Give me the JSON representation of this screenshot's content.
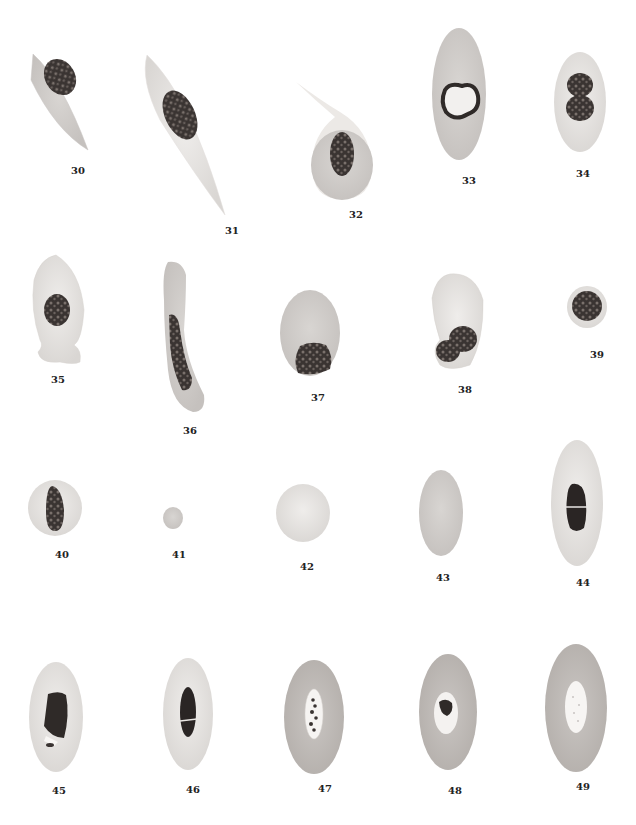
{
  "plate": {
    "figures": [
      {
        "id": "30",
        "label": "30",
        "shape": "spindle",
        "nucleus": "oval-granular"
      },
      {
        "id": "31",
        "label": "31",
        "shape": "elongated-spindle",
        "nucleus": "oval-granular"
      },
      {
        "id": "32",
        "label": "32",
        "shape": "teardrop-with-tail",
        "nucleus": "oval-granular"
      },
      {
        "id": "33",
        "label": "33",
        "shape": "oval",
        "nucleus": "lobed-ring"
      },
      {
        "id": "34",
        "label": "34",
        "shape": "oval",
        "nucleus": "constricted-double"
      },
      {
        "id": "35",
        "label": "35",
        "shape": "pear-with-bulb",
        "nucleus": "oval-granular"
      },
      {
        "id": "36",
        "label": "36",
        "shape": "curved-rod",
        "nucleus": "elongated"
      },
      {
        "id": "37",
        "label": "37",
        "shape": "oval",
        "nucleus": "basal-granular"
      },
      {
        "id": "38",
        "label": "38",
        "shape": "kidney",
        "nucleus": "dividing-double"
      },
      {
        "id": "39",
        "label": "39",
        "shape": "small-round",
        "nucleus": "round-granular"
      },
      {
        "id": "40",
        "label": "40",
        "shape": "round",
        "nucleus": "eccentric-oval"
      },
      {
        "id": "41",
        "label": "41",
        "shape": "tiny-round",
        "nucleus": "none"
      },
      {
        "id": "42",
        "label": "42",
        "shape": "round",
        "nucleus": "none"
      },
      {
        "id": "43",
        "label": "43",
        "shape": "oval",
        "nucleus": "none"
      },
      {
        "id": "44",
        "label": "44",
        "shape": "large-oval",
        "nucleus": "split-dark"
      },
      {
        "id": "45",
        "label": "45",
        "shape": "large-oval",
        "nucleus": "fragmented"
      },
      {
        "id": "46",
        "label": "46",
        "shape": "large-oval",
        "nucleus": "split-dark"
      },
      {
        "id": "47",
        "label": "47",
        "shape": "large-oval-dark",
        "nucleus": "vacuole-beaded"
      },
      {
        "id": "48",
        "label": "48",
        "shape": "large-oval-dark",
        "nucleus": "vacuole-clump"
      },
      {
        "id": "49",
        "label": "49",
        "shape": "large-oval-dark",
        "nucleus": "vacuole-pale"
      }
    ]
  }
}
